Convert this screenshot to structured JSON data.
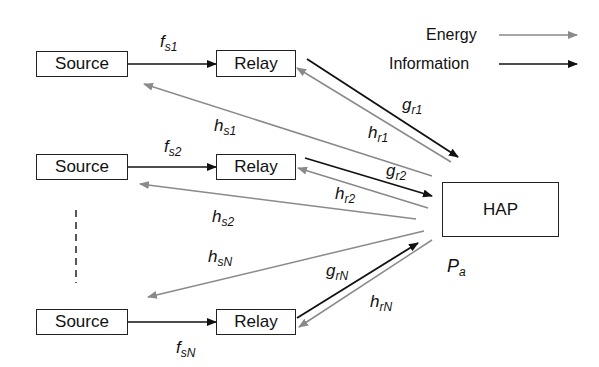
{
  "legend": {
    "energy_label": "Energy",
    "information_label": "Information",
    "energy_color": "#8a8a8a",
    "information_color": "#111111"
  },
  "nodes": {
    "source1": "Source",
    "relay1": "Relay",
    "source2": "Source",
    "relay2": "Relay",
    "sourceN": "Source",
    "relayN": "Relay",
    "hap": "HAP"
  },
  "labels": {
    "fs1": {
      "base": "f",
      "sub": "s1"
    },
    "fs2": {
      "base": "f",
      "sub": "s2"
    },
    "fsN": {
      "base": "f",
      "sub": "sN"
    },
    "gr1": {
      "base": "g",
      "sub": "r1"
    },
    "gr2": {
      "base": "g",
      "sub": "r2"
    },
    "grN": {
      "base": "g",
      "sub": "rN"
    },
    "hr1": {
      "base": "h",
      "sub": "r1"
    },
    "hr2": {
      "base": "h",
      "sub": "r2"
    },
    "hrN": {
      "base": "h",
      "sub": "rN"
    },
    "hs1": {
      "base": "h",
      "sub": "s1"
    },
    "hs2": {
      "base": "h",
      "sub": "s2"
    },
    "hsN": {
      "base": "h",
      "sub": "sN"
    },
    "pa": {
      "base": "P",
      "sub": "a"
    }
  }
}
